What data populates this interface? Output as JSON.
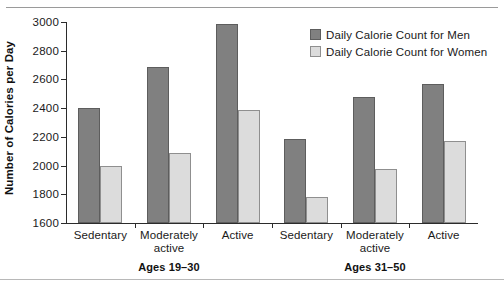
{
  "chart_data": {
    "type": "bar",
    "title": "",
    "xlabel": "",
    "ylabel": "Number of Calories per Day",
    "ylim": [
      1600,
      3000
    ],
    "yticks": [
      1600,
      1800,
      2000,
      2200,
      2400,
      2600,
      2800,
      3000
    ],
    "grid": false,
    "legend_position": "top-right",
    "categories": [
      "Sedentary",
      "Moderately active",
      "Active",
      "Sedentary",
      "Moderately active",
      "Active"
    ],
    "category_lines": [
      [
        "Sedentary"
      ],
      [
        "Moderately",
        "active"
      ],
      [
        "Active"
      ],
      [
        "Sedentary"
      ],
      [
        "Moderately",
        "active"
      ],
      [
        "Active"
      ]
    ],
    "groups": [
      {
        "label": "Ages 19–30",
        "categories": [
          0,
          1,
          2
        ]
      },
      {
        "label": "Ages 31–50",
        "categories": [
          3,
          4,
          5
        ]
      }
    ],
    "series": [
      {
        "name": "Daily Calorie Count for Men",
        "color": "#808080",
        "values": [
          2400,
          2690,
          2985,
          2185,
          2480,
          2570
        ]
      },
      {
        "name": "Daily Calorie Count for Women",
        "color": "#dcdcdc",
        "values": [
          2000,
          2090,
          2385,
          1780,
          1975,
          2170
        ]
      }
    ]
  },
  "axis": {
    "tick_labels": [
      "3000",
      "2800",
      "2600",
      "2400",
      "2200",
      "2000",
      "1800",
      "1600"
    ],
    "y_title": "Number of Calories per Day"
  },
  "legend": {
    "items": [
      {
        "label": "Daily Calorie Count for Men",
        "swatch": "men"
      },
      {
        "label": "Daily Calorie Count for Women",
        "swatch": "women"
      }
    ]
  }
}
